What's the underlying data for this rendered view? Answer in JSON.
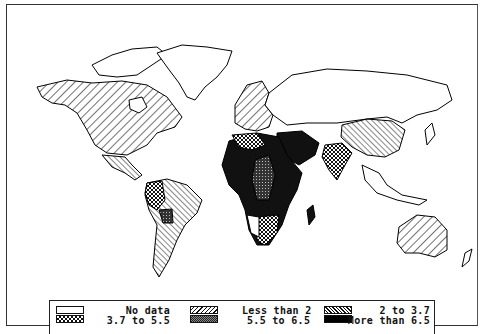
{
  "map": {
    "type": "choropleth-world",
    "categories": [
      {
        "id": "nodata",
        "label": "No data",
        "pattern": "blank"
      },
      {
        "id": "lt2",
        "label": "Less than 2",
        "pattern": "wide-forward-hatch"
      },
      {
        "id": "2to37",
        "label": "2 to 3.7",
        "pattern": "back-hatch"
      },
      {
        "id": "37to55",
        "label": "3.7 to 5.5",
        "pattern": "checker-crosshatch"
      },
      {
        "id": "55to65",
        "label": "5.5 to 6.5",
        "pattern": "dense-dark-crosshatch"
      },
      {
        "id": "gt65",
        "label": "More than 6.5",
        "pattern": "solid-black"
      }
    ],
    "regions": [
      {
        "name": "North America (USA, Canada)",
        "category": "lt2"
      },
      {
        "name": "Greenland",
        "category": "nodata"
      },
      {
        "name": "Europe",
        "category": "lt2"
      },
      {
        "name": "USSR",
        "category": "nodata"
      },
      {
        "name": "China",
        "category": "2to37"
      },
      {
        "name": "India",
        "category": "37to55"
      },
      {
        "name": "South America (Brazil, Argentina)",
        "category": "2to37"
      },
      {
        "name": "Andean countries",
        "category": "37to55"
      },
      {
        "name": "Bolivia/Paraguay",
        "category": "55to65"
      },
      {
        "name": "North Africa",
        "category": "37to55"
      },
      {
        "name": "Sub-Saharan Africa",
        "category": "gt65"
      },
      {
        "name": "Central Africa",
        "category": "55to65"
      },
      {
        "name": "Southern Africa",
        "category": "37to55"
      },
      {
        "name": "Namibia",
        "category": "nodata"
      },
      {
        "name": "Middle East / Arabia",
        "category": "gt65"
      },
      {
        "name": "Australia",
        "category": "lt2"
      },
      {
        "name": "Mexico",
        "category": "2to37"
      }
    ]
  },
  "legend": {
    "col1": {
      "top": "No data",
      "bottom": "3.7 to 5.5"
    },
    "col2": {
      "top": "Less than 2",
      "bottom": "5.5 to 6.5"
    },
    "col3": {
      "top": "2 to 3.7",
      "bottom": "More than 6.5"
    }
  }
}
